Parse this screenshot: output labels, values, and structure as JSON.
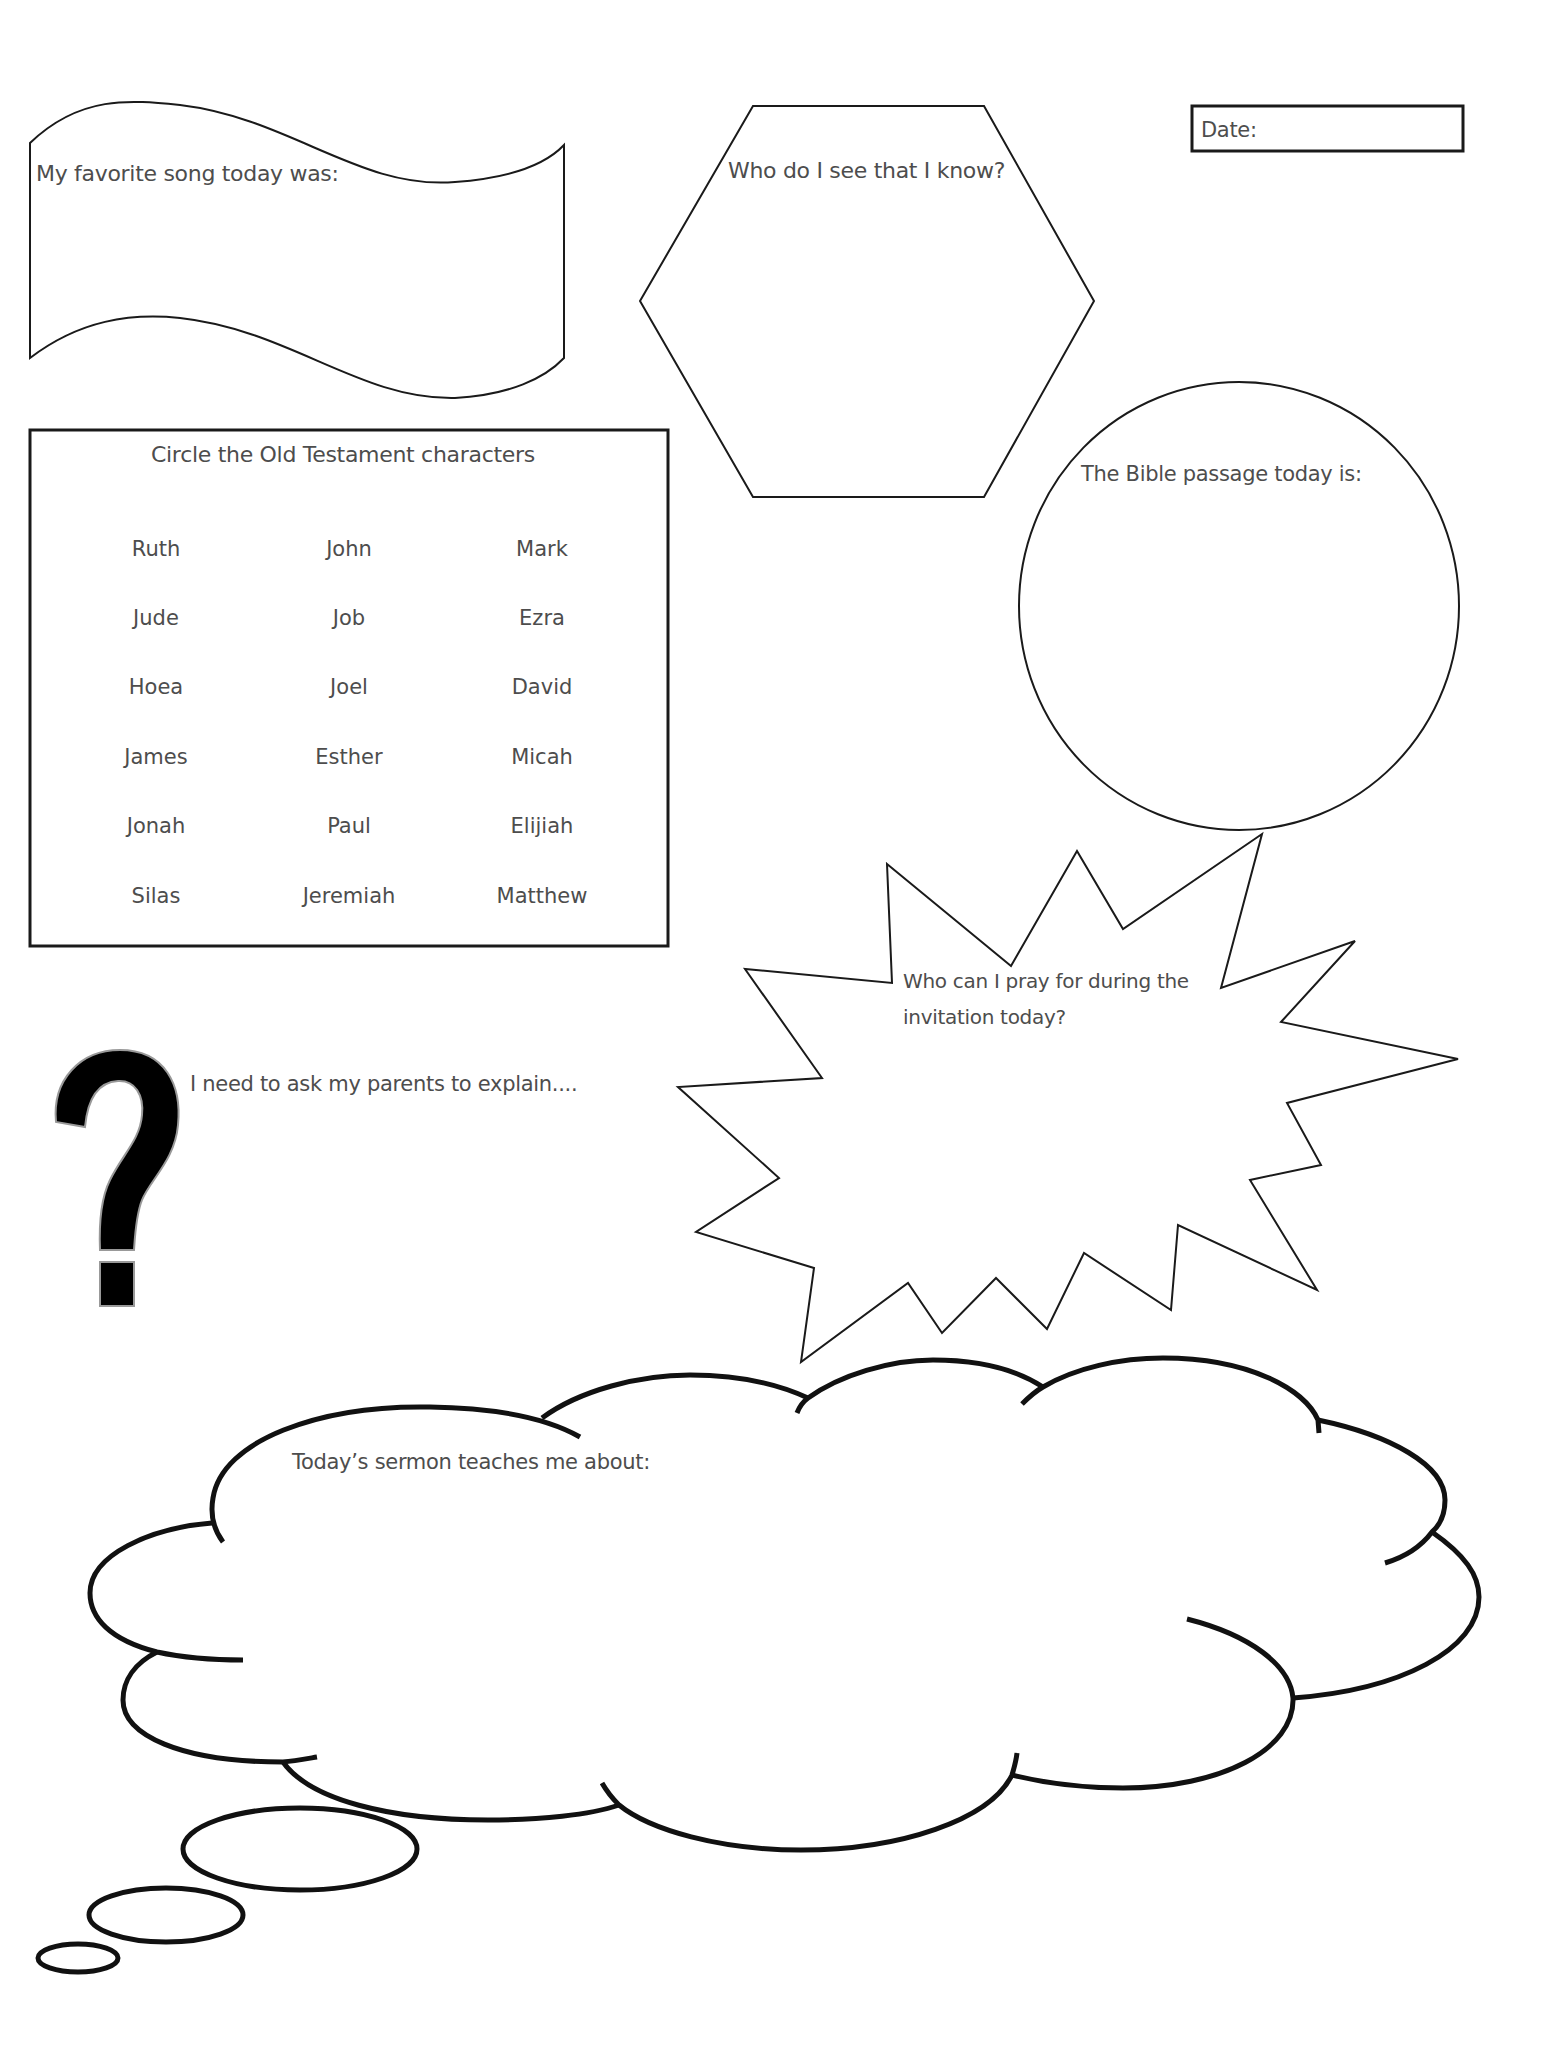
{
  "worksheet": {
    "date_label": "Date:",
    "favorite_song_label": "My favorite song today was:",
    "who_do_i_see_label": "Who do I see that I know?",
    "bible_passage_label": "The Bible passage today is:",
    "old_testament": {
      "title": "Circle the Old Testament characters",
      "names": [
        [
          "Ruth",
          "John",
          "Mark"
        ],
        [
          "Jude",
          "Job",
          "Ezra"
        ],
        [
          "Hoea",
          "Joel",
          "David"
        ],
        [
          "James",
          "Esther",
          "Micah"
        ],
        [
          "Jonah",
          "Paul",
          "Elijiah"
        ],
        [
          "Silas",
          "Jeremiah",
          "Matthew"
        ]
      ]
    },
    "pray_label_line1": "Who can I pray for during the",
    "pray_label_line2": "invitation today?",
    "ask_parents_label": "I need to ask my parents to explain....",
    "question_mark_glyph": "?",
    "sermon_label": "Today’s sermon teaches me about:"
  },
  "colors": {
    "outline": "#1a1a1a",
    "text": "#4d4d4d",
    "background": "#ffffff"
  }
}
